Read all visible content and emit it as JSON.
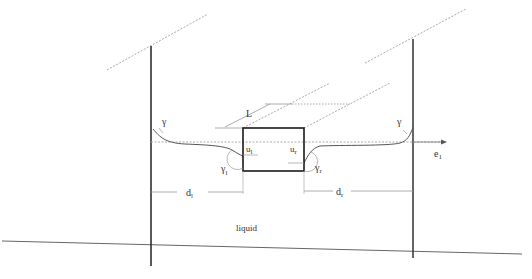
{
  "diagram": {
    "labels": {
      "gamma_left": "γ",
      "gamma_right": "γ",
      "length": "L",
      "u_left": "u",
      "u_left_sub": "l",
      "u_right": "u",
      "u_right_sub": "r",
      "gamma_l": "γ",
      "gamma_l_sub": "l",
      "gamma_r": "γ",
      "gamma_r_sub": "r",
      "axis": "e",
      "axis_sub": "1",
      "d_left": "d",
      "d_left_sub": "l",
      "d_right": "d",
      "d_right_sub": "r",
      "liquid": "liquid"
    },
    "colors": {
      "wall": "#222222",
      "box": "#1a1a1a",
      "meniscus": "#555555",
      "dashed": "#aaaaaa",
      "thin": "#999999",
      "ground": "#666666"
    }
  }
}
